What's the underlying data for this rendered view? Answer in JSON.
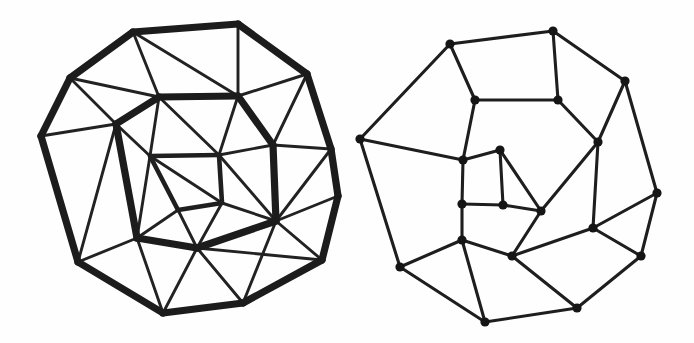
{
  "figure": {
    "background_color": "#fefefe",
    "ink_color": "#1c1c1c",
    "width": 694,
    "height": 343,
    "style": "hand-drawn pen sketch"
  },
  "chart_data": {
    "type": "diagram",
    "panels": [
      {
        "name": "left-panel",
        "label": "triangulated-polyhedral-graph",
        "description": "Hand-drawn triangulated planar graph with a heavy decagonal outer boundary, a heavy inner ring and a small inner quadrilateral; all faces triangulated with thinner chords.",
        "show_vertex_dots": false,
        "stroke_weights": [
          "thick",
          "medium",
          "thin"
        ],
        "vertex_count": 21,
        "vertices": [
          {
            "id": "L0",
            "x": 238,
            "y": 24
          },
          {
            "id": "L1",
            "x": 307,
            "y": 74
          },
          {
            "id": "L2",
            "x": 331,
            "y": 149
          },
          {
            "id": "L3",
            "x": 338,
            "y": 196
          },
          {
            "id": "L4",
            "x": 322,
            "y": 260
          },
          {
            "id": "L5",
            "x": 243,
            "y": 303
          },
          {
            "id": "L6",
            "x": 163,
            "y": 313
          },
          {
            "id": "L7",
            "x": 78,
            "y": 262
          },
          {
            "id": "L8",
            "x": 41,
            "y": 136
          },
          {
            "id": "L9",
            "x": 70,
            "y": 78
          },
          {
            "id": "L10",
            "x": 133,
            "y": 32
          },
          {
            "id": "L11",
            "x": 159,
            "y": 97
          },
          {
            "id": "L12",
            "x": 238,
            "y": 96
          },
          {
            "id": "L13",
            "x": 273,
            "y": 145
          },
          {
            "id": "L14",
            "x": 276,
            "y": 221
          },
          {
            "id": "L15",
            "x": 197,
            "y": 248
          },
          {
            "id": "L16",
            "x": 137,
            "y": 238
          },
          {
            "id": "L17",
            "x": 116,
            "y": 124
          },
          {
            "id": "L18",
            "x": 150,
            "y": 156
          },
          {
            "id": "L19",
            "x": 219,
            "y": 155
          },
          {
            "id": "L20",
            "x": 222,
            "y": 203
          },
          {
            "id": "L21",
            "x": 178,
            "y": 210
          }
        ],
        "edge_groups": {
          "outer_ring_thick": [
            [
              "L0",
              "L1"
            ],
            [
              "L1",
              "L2"
            ],
            [
              "L2",
              "L3"
            ],
            [
              "L3",
              "L4"
            ],
            [
              "L4",
              "L5"
            ],
            [
              "L5",
              "L6"
            ],
            [
              "L6",
              "L7"
            ],
            [
              "L7",
              "L8"
            ],
            [
              "L8",
              "L9"
            ],
            [
              "L9",
              "L10"
            ],
            [
              "L10",
              "L0"
            ]
          ],
          "inner_ring_thick": [
            [
              "L11",
              "L12"
            ],
            [
              "L12",
              "L13"
            ],
            [
              "L13",
              "L14"
            ],
            [
              "L14",
              "L15"
            ],
            [
              "L15",
              "L16"
            ],
            [
              "L16",
              "L17"
            ],
            [
              "L17",
              "L11"
            ]
          ],
          "core_quad_thick": [
            [
              "L18",
              "L19"
            ],
            [
              "L19",
              "L20"
            ],
            [
              "L20",
              "L21"
            ],
            [
              "L21",
              "L18"
            ]
          ],
          "chords_thin": [
            [
              "L0",
              "L12"
            ],
            [
              "L10",
              "L11"
            ],
            [
              "L9",
              "L11"
            ],
            [
              "L1",
              "L12"
            ],
            [
              "L1",
              "L13"
            ],
            [
              "L2",
              "L13"
            ],
            [
              "L2",
              "L14"
            ],
            [
              "L3",
              "L14"
            ],
            [
              "L4",
              "L14"
            ],
            [
              "L4",
              "L15"
            ],
            [
              "L5",
              "L15"
            ],
            [
              "L5",
              "L14"
            ],
            [
              "L6",
              "L15"
            ],
            [
              "L6",
              "L16"
            ],
            [
              "L7",
              "L16"
            ],
            [
              "L7",
              "L17"
            ],
            [
              "L8",
              "L17"
            ],
            [
              "L9",
              "L17"
            ],
            [
              "L8",
              "L7"
            ],
            [
              "L11",
              "L18"
            ],
            [
              "L12",
              "L19"
            ],
            [
              "L13",
              "L19"
            ],
            [
              "L14",
              "L20"
            ],
            [
              "L15",
              "L21"
            ],
            [
              "L16",
              "L21"
            ],
            [
              "L17",
              "L18"
            ],
            [
              "L11",
              "L19"
            ],
            [
              "L18",
              "L20"
            ],
            [
              "L19",
              "L14"
            ],
            [
              "L15",
              "L20"
            ],
            [
              "L16",
              "L18"
            ],
            [
              "L12",
              "L11"
            ],
            [
              "L10",
              "L12"
            ]
          ]
        }
      },
      {
        "name": "right-panel",
        "label": "cubic-planar-dual-graph",
        "description": "Hand-drawn 3-regular (cubic) planar graph of uniform thin stroke with filled round dots at every vertex; nonagonal outer boundary with spiral-arranged inner quadrilateral and pentagonal faces.",
        "show_vertex_dots": true,
        "stroke_weights": [
          "plain"
        ],
        "vertex_count": 20,
        "vertices": [
          {
            "id": "R0",
            "x": 553,
            "y": 31
          },
          {
            "id": "R1",
            "x": 625,
            "y": 81
          },
          {
            "id": "R2",
            "x": 657,
            "y": 193
          },
          {
            "id": "R3",
            "x": 641,
            "y": 256
          },
          {
            "id": "R4",
            "x": 577,
            "y": 308
          },
          {
            "id": "R5",
            "x": 485,
            "y": 322
          },
          {
            "id": "R6",
            "x": 400,
            "y": 267
          },
          {
            "id": "R7",
            "x": 360,
            "y": 139
          },
          {
            "id": "R8",
            "x": 450,
            "y": 44
          },
          {
            "id": "R9",
            "x": 475,
            "y": 100
          },
          {
            "id": "R10",
            "x": 558,
            "y": 100
          },
          {
            "id": "R11",
            "x": 598,
            "y": 142
          },
          {
            "id": "R12",
            "x": 593,
            "y": 228
          },
          {
            "id": "R13",
            "x": 512,
            "y": 256
          },
          {
            "id": "R14",
            "x": 462,
            "y": 240
          },
          {
            "id": "R15",
            "x": 463,
            "y": 160
          },
          {
            "id": "R16",
            "x": 500,
            "y": 150
          },
          {
            "id": "R17",
            "x": 541,
            "y": 211
          },
          {
            "id": "R18",
            "x": 503,
            "y": 205
          },
          {
            "id": "R19",
            "x": 462,
            "y": 204
          }
        ],
        "edges": [
          [
            "R0",
            "R1"
          ],
          [
            "R1",
            "R2"
          ],
          [
            "R2",
            "R3"
          ],
          [
            "R3",
            "R4"
          ],
          [
            "R4",
            "R5"
          ],
          [
            "R5",
            "R6"
          ],
          [
            "R6",
            "R7"
          ],
          [
            "R7",
            "R8"
          ],
          [
            "R8",
            "R0"
          ],
          [
            "R0",
            "R10"
          ],
          [
            "R8",
            "R9"
          ],
          [
            "R9",
            "R10"
          ],
          [
            "R1",
            "R11"
          ],
          [
            "R10",
            "R11"
          ],
          [
            "R11",
            "R12"
          ],
          [
            "R2",
            "R12"
          ],
          [
            "R12",
            "R13"
          ],
          [
            "R3",
            "R12"
          ],
          [
            "R4",
            "R13"
          ],
          [
            "R13",
            "R14"
          ],
          [
            "R5",
            "R14"
          ],
          [
            "R6",
            "R14"
          ],
          [
            "R7",
            "R15"
          ],
          [
            "R9",
            "R15"
          ],
          [
            "R15",
            "R16"
          ],
          [
            "R16",
            "R17"
          ],
          [
            "R11",
            "R17"
          ],
          [
            "R17",
            "R13"
          ],
          [
            "R16",
            "R18"
          ],
          [
            "R18",
            "R19"
          ],
          [
            "R19",
            "R15"
          ],
          [
            "R18",
            "R17"
          ],
          [
            "R19",
            "R14"
          ]
        ]
      }
    ]
  }
}
